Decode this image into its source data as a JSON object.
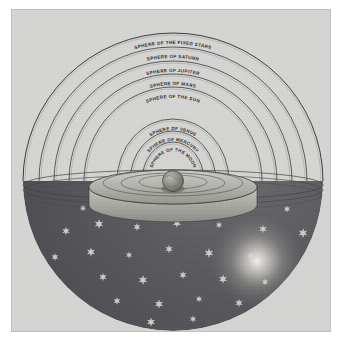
{
  "figure": {
    "name": "geocentric-cosmos-diagram",
    "background_color": "#d6d6d4",
    "ink_color": "#2b2b2b",
    "hemisphere_color": "#55555a",
    "star_color": "#d8d8d2",
    "glow_color": "#f0efe4",
    "earth_color": "#8e8e8c"
  },
  "spheres": [
    {
      "id": "fixed-stars",
      "label": "SPHERE OF THE FIXED STARS",
      "order": 1,
      "rx": 150,
      "ry": 148,
      "label_rx": 139,
      "label_ry": 137
    },
    {
      "id": "saturn",
      "label": "SPHERE OF SATURN",
      "order": 2,
      "rx": 134,
      "ry": 134,
      "label_rx": 123,
      "label_ry": 123
    },
    {
      "id": "jupiter",
      "label": "SPHERE OF JUPITER",
      "order": 3,
      "rx": 119,
      "ry": 120,
      "label_rx": 108,
      "label_ry": 109
    },
    {
      "id": "mars",
      "label": "SPHERE OF MARS",
      "order": 4,
      "rx": 104,
      "ry": 107,
      "label_rx": 93,
      "label_ry": 96
    },
    {
      "id": "sun",
      "label": "SPHERE OF THE SUN",
      "order": 5,
      "rx": 89,
      "ry": 94,
      "label_rx": 78,
      "label_ry": 83
    },
    {
      "id": "venus",
      "label": "SPHERE OF VENUS",
      "order": 6,
      "rx": 56,
      "ry": 62,
      "label_rx": 46,
      "label_ry": 51
    },
    {
      "id": "mercury",
      "label": "SPHERE OF MERCURY",
      "order": 7,
      "rx": 43,
      "ry": 50,
      "label_rx": 34,
      "label_ry": 40
    },
    {
      "id": "moon",
      "label": "SPHERE OF THE MOON",
      "order": 8,
      "rx": 31,
      "ry": 39,
      "label_rx": 23,
      "label_ry": 30
    }
  ],
  "center": {
    "label": "Earth",
    "cx": 162,
    "cy": 172
  },
  "stars": {
    "count": 40,
    "points": 6,
    "positions": [
      [
        72,
        199
      ],
      [
        108,
        193
      ],
      [
        148,
        196
      ],
      [
        196,
        191
      ],
      [
        238,
        196
      ],
      [
        276,
        200
      ],
      [
        55,
        222
      ],
      [
        88,
        215
      ],
      [
        126,
        218
      ],
      [
        166,
        214
      ],
      [
        208,
        216
      ],
      [
        252,
        220
      ],
      [
        292,
        224
      ],
      [
        44,
        248
      ],
      [
        80,
        243
      ],
      [
        118,
        246
      ],
      [
        158,
        240
      ],
      [
        198,
        244
      ],
      [
        240,
        247
      ],
      [
        282,
        250
      ],
      [
        52,
        272
      ],
      [
        92,
        268
      ],
      [
        132,
        271
      ],
      [
        172,
        266
      ],
      [
        212,
        270
      ],
      [
        254,
        273
      ],
      [
        290,
        276
      ],
      [
        68,
        294
      ],
      [
        106,
        292
      ],
      [
        148,
        295
      ],
      [
        188,
        290
      ],
      [
        228,
        294
      ],
      [
        266,
        296
      ],
      [
        96,
        312
      ],
      [
        140,
        313
      ],
      [
        182,
        310
      ],
      [
        222,
        314
      ],
      [
        258,
        312
      ],
      [
        120,
        328
      ],
      [
        200,
        327
      ]
    ]
  },
  "glow": {
    "cx": 246,
    "cy": 252,
    "r": 44
  }
}
